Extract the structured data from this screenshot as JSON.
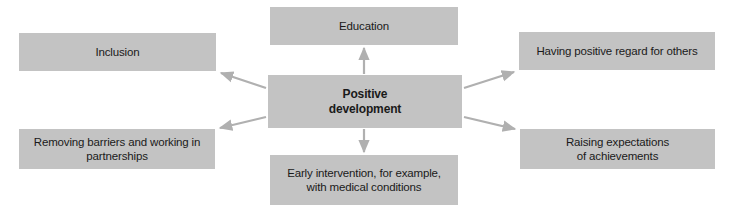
{
  "diagram": {
    "title": "Positive development",
    "type": "hub-and-spoke concept map",
    "colors": {
      "box_fill": "#c3c3c3",
      "text": "#1a1a1a",
      "arrow": "#b0b0b0",
      "background": "#ffffff"
    },
    "center": {
      "id": "positive-development",
      "label": "Positive\ndevelopment"
    },
    "nodes": [
      {
        "id": "education",
        "label": "Education",
        "position": "top"
      },
      {
        "id": "inclusion",
        "label": "Inclusion",
        "position": "top-left"
      },
      {
        "id": "positive-regard",
        "label": "Having positive regard for others",
        "position": "top-right"
      },
      {
        "id": "removing-barriers",
        "label": "Removing barriers and working in\npartnerships",
        "position": "bottom-left"
      },
      {
        "id": "raising-expectations",
        "label": "Raising expectations\nof achievements",
        "position": "bottom-right"
      },
      {
        "id": "early-intervention",
        "label": "Early intervention, for example,\nwith medical conditions",
        "position": "bottom"
      }
    ],
    "arrows": [
      {
        "from": "positive-development",
        "to": "education",
        "direction": "up"
      },
      {
        "from": "positive-development",
        "to": "inclusion",
        "direction": "up-left"
      },
      {
        "from": "positive-development",
        "to": "positive-regard",
        "direction": "up-right"
      },
      {
        "from": "positive-development",
        "to": "removing-barriers",
        "direction": "down-left"
      },
      {
        "from": "positive-development",
        "to": "raising-expectations",
        "direction": "down-right"
      },
      {
        "from": "positive-development",
        "to": "early-intervention",
        "direction": "down"
      }
    ]
  }
}
